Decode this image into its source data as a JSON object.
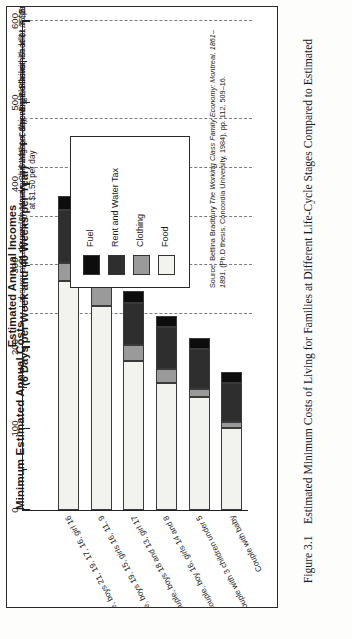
{
  "figure": {
    "caption_label": "Figure 3.1",
    "caption_text": "Estimated Minimum Costs of Living for Families at Different Life-Cycle Stages Compared to Estimated"
  },
  "header": {
    "line1": "Estimated Annual Incomes",
    "line2": "(6 Days per Week and 40 Weeks per Year)"
  },
  "axis": {
    "title": "Minimum Estimated Annual Costs",
    "currency_symbol": "$",
    "ticks": [
      "600",
      "500",
      "400",
      "300",
      "200",
      "100",
      "0"
    ],
    "max": 600,
    "min": 0
  },
  "legend": {
    "items": [
      {
        "label": "Fuel",
        "color": "#0d0d0d"
      },
      {
        "label": "Rent and Water Tax",
        "color": "#2e2e2e"
      },
      {
        "label": "Clothing",
        "color": "#9a9a9a"
      },
      {
        "label": "Food",
        "color": "#f2f2ef"
      }
    ]
  },
  "income_lines": [
    {
      "value": 600,
      "label": "Engine Driver, Saddler at $2.50 per day"
    },
    {
      "value": 480,
      "label": "Engine Driver, Saddler at $2.00 per day"
    },
    {
      "value": 420,
      "label": "Mason, Shipwright, Blacksmith at $1.75 per day"
    },
    {
      "value": 360,
      "label": "Mason, Shipwright, Carpenter, Blacksmith\nat $1.50 per day"
    },
    {
      "value": 300,
      "label": "Labourer, Shoemaker at $1.25 per day"
    },
    {
      "value": 240,
      "label": "Labourer at $1.00 per day"
    }
  ],
  "source": {
    "prefix": "Source: Bettina Bradbury ",
    "title": "The Working Class Family Economy: Montreal, 1861–1891",
    "suffix": ", (Ph.D thesis, Concordia University, 1984), pp. 112, 509–16."
  },
  "chart_data": {
    "type": "bar",
    "orientation": "horizontal-stacked",
    "xlabel": "Minimum Estimated Annual Costs",
    "ylabel": "",
    "xlim": [
      0,
      600
    ],
    "grid": "dashed vertical income reference lines",
    "legend_position": "upper right inside box",
    "categories": [
      "Couple with baby",
      "Couple with 3 children under 5",
      "Couple, boy 16, girls 14 and 8",
      "Couple, boys 18 and 13, girl 17",
      "Couple, boys 19, 15, girls 16, 11, 9",
      "Couple, boys 21, 19, 17, 16, girl 16"
    ],
    "series": [
      {
        "name": "Food",
        "color": "#f2f2ef",
        "values": [
          101,
          139,
          156,
          183,
          250,
          281
        ]
      },
      {
        "name": "Clothing",
        "color": "#9a9a9a",
        "values": [
          7,
          9,
          17,
          19,
          28,
          22
        ]
      },
      {
        "name": "Rent and Water Tax",
        "color": "#2e2e2e",
        "values": [
          48,
          50,
          51,
          52,
          66,
          65
        ]
      },
      {
        "name": "Fuel",
        "color": "#0d0d0d",
        "values": [
          13,
          13,
          14,
          15,
          17,
          17
        ]
      }
    ],
    "totals": [
      169,
      211,
      238,
      269,
      361,
      385
    ]
  }
}
